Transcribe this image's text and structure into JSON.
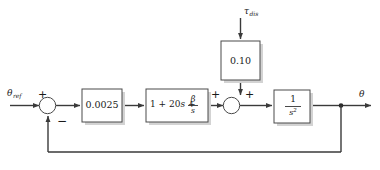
{
  "diagram": {
    "type": "control-block-diagram",
    "background_color": "#ffffff",
    "line_color": "#3a3a3a",
    "block_fill": "#ffffff",
    "block_stroke": "#4a4a4a",
    "shadow_color": "#d3d3d3"
  },
  "inputs": {
    "reference": {
      "symbol": "θ",
      "subscript": "ref",
      "label": "θ_ref"
    },
    "disturbance": {
      "symbol": "τ",
      "subscript": "dis",
      "label": "τ_dis"
    }
  },
  "outputs": {
    "plant_output": {
      "symbol": "θ",
      "label": "θ"
    }
  },
  "blocks": [
    {
      "id": "gain",
      "label": "0.0025",
      "kind": "gain"
    },
    {
      "id": "controller",
      "label": "1 + 20s + β/s",
      "kind": "pid-controller",
      "prefix": "1 + 20",
      "var_s": "s",
      "plus": "+",
      "numerator": "β",
      "denominator": "s"
    },
    {
      "id": "disturbance_gain",
      "label": "0.10",
      "kind": "gain"
    },
    {
      "id": "plant",
      "label": "1/s²",
      "kind": "double-integrator",
      "numerator": "1",
      "denominator": "s",
      "exponent": "2"
    }
  ],
  "summing_junctions": [
    {
      "id": "error-sum",
      "signs": {
        "reference_input": "+",
        "feedback_input": "−"
      }
    },
    {
      "id": "disturbance-sum",
      "signs": {
        "forward_input": "+",
        "disturbance_input": "+"
      }
    }
  ],
  "feedback": {
    "type": "unity",
    "sign": "−"
  }
}
